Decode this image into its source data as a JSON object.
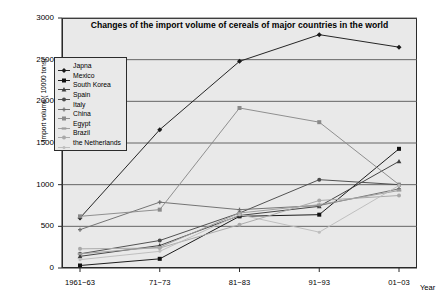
{
  "chart_data": {
    "type": "line",
    "title": "Changes of the import volume of cereals of major countries in the world",
    "xlabel": "Year",
    "ylabel": "Import volume ( 10000 tons)",
    "categories": [
      "1961−63",
      "71−73",
      "81−83",
      "91−93",
      "01−03"
    ],
    "ylim": [
      0,
      3000
    ],
    "ytick_labels": [
      "0",
      "500",
      "1000",
      "1500",
      "2000",
      "2500",
      "3000"
    ],
    "yticks": [
      0,
      500,
      1000,
      1500,
      2000,
      2500,
      3000
    ],
    "grid": "horizontal",
    "legend_position": "inside-upper-left",
    "series": [
      {
        "name": "Japna",
        "marker": "diamond",
        "color": "#1a1a1a",
        "values": [
          600,
          1660,
          2480,
          2800,
          2650
        ]
      },
      {
        "name": "Mexico",
        "marker": "square",
        "color": "#111111",
        "values": [
          30,
          110,
          620,
          640,
          1430
        ]
      },
      {
        "name": "South Korea",
        "marker": "triangle",
        "color": "#3d3d3d",
        "values": [
          140,
          270,
          630,
          740,
          1280
        ]
      },
      {
        "name": "Spain",
        "marker": "circle",
        "color": "#4a4a4a",
        "values": [
          170,
          330,
          660,
          1060,
          1000
        ]
      },
      {
        "name": "Italy",
        "marker": "cross",
        "color": "#6e6e6e",
        "values": [
          460,
          790,
          700,
          750,
          950
        ]
      },
      {
        "name": "China",
        "marker": "square",
        "color": "#8a8a8a",
        "values": [
          620,
          700,
          1920,
          1750,
          1000
        ]
      },
      {
        "name": "Egypt",
        "marker": "bar",
        "color": "#9d9d9d",
        "values": [
          170,
          250,
          660,
          760,
          930
        ]
      },
      {
        "name": "Brazil",
        "marker": "circle",
        "color": "#a8a8a8",
        "values": [
          230,
          240,
          520,
          810,
          870
        ]
      },
      {
        "name": "the Netherlands",
        "marker": "dot",
        "color": "#bdbdbd",
        "values": [
          100,
          200,
          640,
          430,
          990
        ]
      }
    ]
  },
  "colors": {
    "plot_background": "#e9e9e9",
    "page_background": "#ffffff",
    "axis": "#2b2b2b",
    "gridline": "#555555",
    "text": "#000000"
  }
}
